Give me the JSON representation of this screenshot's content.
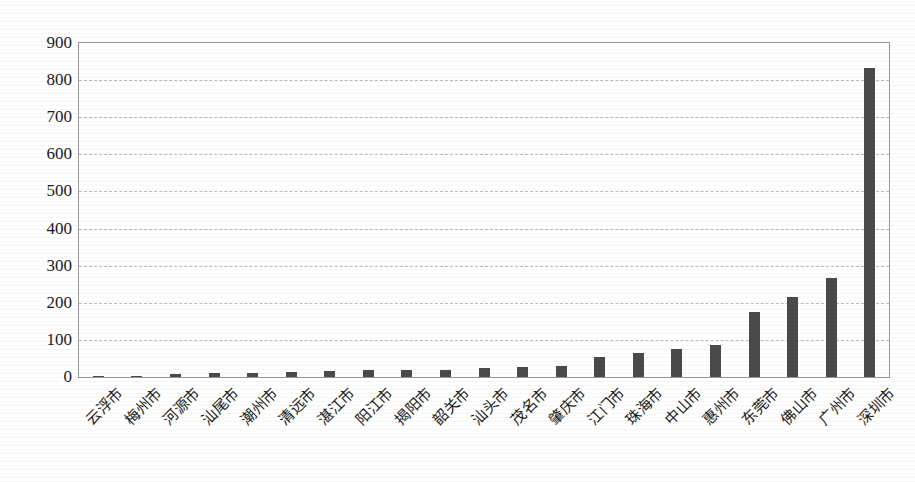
{
  "chart_data": {
    "type": "bar",
    "title": "",
    "subtitle": "",
    "xlabel": "",
    "ylabel": "",
    "ylim": [
      0,
      900
    ],
    "ytick_step": 100,
    "grid": true,
    "legend": "none",
    "bar_color": "#4a4a4a",
    "gridline_color": "#b9b9b9",
    "frame_color": "#9a9a9a",
    "yticks": [
      "0",
      "100",
      "200",
      "300",
      "400",
      "500",
      "600",
      "700",
      "800",
      "900"
    ],
    "categories": [
      "云浮市",
      "梅州市",
      "河源市",
      "汕尾市",
      "潮州市",
      "清远市",
      "湛江市",
      "阳江市",
      "揭阳市",
      "韶关市",
      "汕头市",
      "茂名市",
      "肇庆市",
      "江门市",
      "珠海市",
      "中山市",
      "惠州市",
      "东莞市",
      "佛山市",
      "广州市",
      "深圳市"
    ],
    "values": [
      2,
      4,
      9,
      10,
      12,
      14,
      17,
      18,
      18,
      20,
      25,
      26,
      30,
      55,
      65,
      76,
      87,
      175,
      216,
      266,
      832
    ]
  }
}
